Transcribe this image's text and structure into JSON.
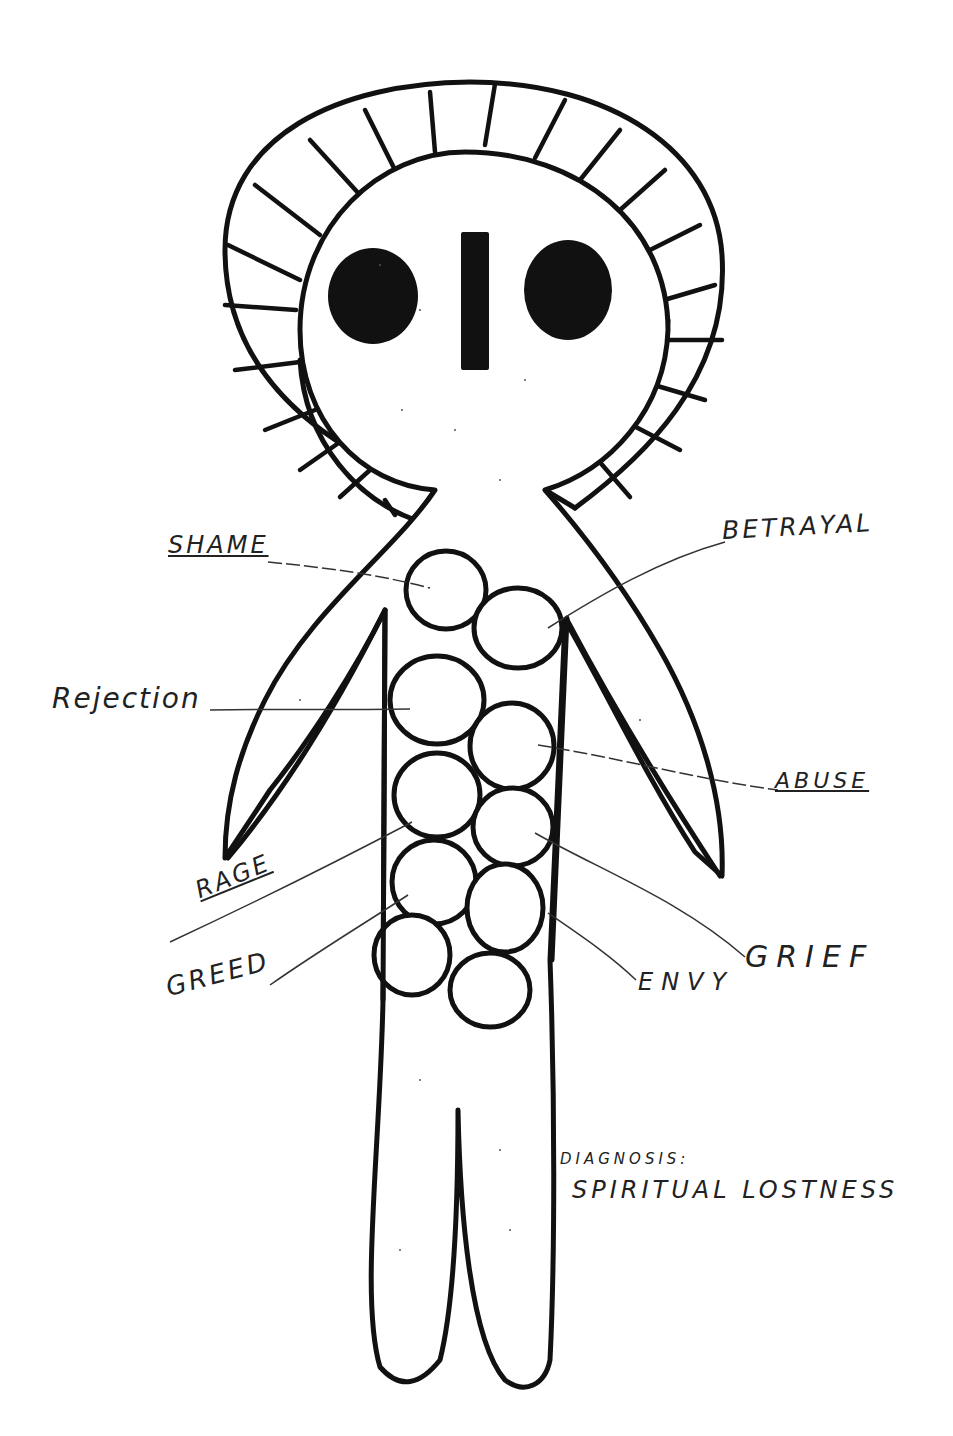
{
  "figure": {
    "colors": {
      "ink": "#111111",
      "leader": "#333333",
      "paper": "#ffffff"
    }
  },
  "labels": {
    "shame": "SHAME",
    "betrayal": "BETRAYAL",
    "rejection": "Rejection",
    "abuse": "ABUSE",
    "rage": "RAGE",
    "greed": "GREED",
    "grief": "GRIEF",
    "envy": "ENVY"
  },
  "diagnosis": {
    "heading": "DIAGNOSIS:",
    "value": "SPIRITUAL LOSTNESS"
  }
}
